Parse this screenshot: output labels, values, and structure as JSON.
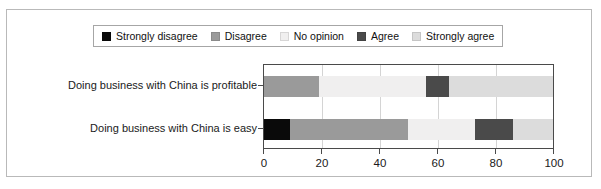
{
  "chart_data": {
    "type": "bar",
    "orientation": "horizontal",
    "stacked": true,
    "stack_total": 100,
    "title": "",
    "subtitle": "",
    "xlabel": "",
    "ylabel": "",
    "xlim": [
      0,
      100
    ],
    "xticks": [
      0,
      20,
      40,
      60,
      80,
      100
    ],
    "xticklabels": [
      "0",
      "20",
      "40",
      "60",
      "80",
      "100"
    ],
    "grid": true,
    "grid_axis": "x",
    "legend_position": "top-center",
    "categories": [
      "Doing business with China is profitable",
      "Doing business with China is easy"
    ],
    "series": [
      {
        "name": "Strongly disagree",
        "color": "#0a0a0a",
        "values": [
          0,
          9
        ]
      },
      {
        "name": "Disagree",
        "color": "#9a9a9a",
        "values": [
          19,
          41
        ]
      },
      {
        "name": "No opinion",
        "color": "#f0efef",
        "values": [
          37,
          23
        ]
      },
      {
        "name": "Agree",
        "color": "#4a4a4a",
        "values": [
          8,
          13
        ]
      },
      {
        "name": "Strongly agree",
        "color": "#dcdcdc",
        "values": [
          36,
          14
        ]
      }
    ],
    "annotations": []
  },
  "legend": {
    "entries": [
      {
        "label": "Strongly disagree",
        "color": "#0a0a0a"
      },
      {
        "label": "Disagree",
        "color": "#9a9a9a"
      },
      {
        "label": "No opinion",
        "color": "#f0efef"
      },
      {
        "label": "Agree",
        "color": "#4a4a4a"
      },
      {
        "label": "Strongly agree",
        "color": "#dcdcdc"
      }
    ]
  },
  "axis": {
    "tick_labels": [
      "0",
      "20",
      "40",
      "60",
      "80",
      "100"
    ]
  },
  "colors": {
    "frame_border": "#b9b9b9",
    "plot_border": "#4a4a4a",
    "gridline": "#d4d4d4",
    "text": "#1a1a1a",
    "background": "#ffffff"
  }
}
